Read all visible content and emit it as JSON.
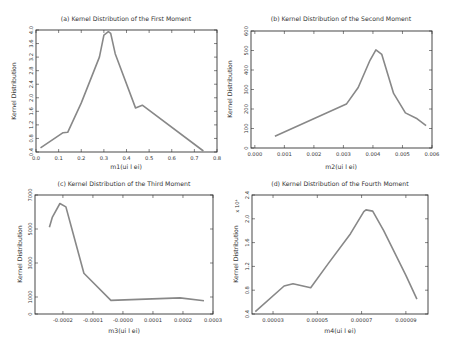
{
  "chart_data": [
    {
      "id": "a",
      "type": "line",
      "title": "(a) Kernel Distribution of the First Moment",
      "xlabel": "m1(ui l ei)",
      "ylabel": "Kernel Distribution",
      "xlim": [
        0.0,
        0.8
      ],
      "ylim": [
        0.4,
        4.0
      ],
      "xticks": [
        0.0,
        0.1,
        0.2,
        0.3,
        0.4,
        0.5,
        0.6,
        0.7,
        0.8
      ],
      "xtick_labels": [
        "0.0",
        "0.1",
        "0.2",
        "0.3",
        "0.4",
        "0.5",
        "0.6",
        "0.7",
        "0.8"
      ],
      "yticks": [
        0.4,
        0.8,
        1.2,
        1.6,
        2.0,
        2.4,
        2.8,
        3.2,
        3.6,
        4.0
      ],
      "ytick_labels": [
        "0.4",
        "0.8",
        "1.2",
        "1.6",
        "2.0",
        "2.4",
        "2.8",
        "3.2",
        "3.6",
        "4.0"
      ],
      "multiplier": "",
      "grid": false,
      "x": [
        0.02,
        0.12,
        0.14,
        0.2,
        0.28,
        0.3,
        0.32,
        0.33,
        0.35,
        0.44,
        0.47,
        0.74
      ],
      "y": [
        0.52,
        0.97,
        0.98,
        1.85,
        3.2,
        3.85,
        3.95,
        3.9,
        3.3,
        1.7,
        1.78,
        0.43
      ],
      "frame": {
        "left": 36,
        "top": 30,
        "right": 217,
        "bottom": 152
      }
    },
    {
      "id": "b",
      "type": "line",
      "title": "(b) Kernel Distribution of the Second Moment",
      "xlabel": "m2(ui l ei)",
      "ylabel": "Kernel Distribution",
      "xlim": [
        -0.00013,
        0.006
      ],
      "ylim": [
        0,
        600
      ],
      "xticks": [
        0.0,
        0.001,
        0.002,
        0.003,
        0.004,
        0.005,
        0.006
      ],
      "xtick_labels": [
        "0.000",
        "0.001",
        "0.002",
        "0.003",
        "0.004",
        "0.005",
        "0.006"
      ],
      "yticks": [
        0,
        100,
        200,
        300,
        400,
        500,
        600
      ],
      "ytick_labels": [
        "0",
        "100",
        "200",
        "300",
        "400",
        "500",
        "600"
      ],
      "multiplier": "",
      "grid": false,
      "x": [
        0.00068,
        0.0031,
        0.0035,
        0.0039,
        0.0041,
        0.0043,
        0.0047,
        0.0051,
        0.0055,
        0.0058
      ],
      "y": [
        60,
        225,
        310,
        450,
        503,
        480,
        280,
        180,
        150,
        115
      ],
      "frame": {
        "left": 251,
        "top": 31,
        "right": 432,
        "bottom": 148
      }
    },
    {
      "id": "c",
      "type": "line",
      "title": "(c) Kernel Distribution of the Third Moment",
      "xlabel": "m3(ui l ei)",
      "ylabel": "Kernel Distribution",
      "xlim": [
        -0.000293,
        0.0003
      ],
      "ylim": [
        0,
        7000
      ],
      "xticks": [
        -0.0002,
        -0.0001,
        0.0,
        0.0001,
        0.0002,
        0.0003
      ],
      "xtick_labels": [
        "-0.0002",
        "-0.0001",
        "-0.0000",
        "0.0001",
        "0.0002",
        "0.0003"
      ],
      "yticks": [
        0,
        1000,
        3000,
        5000,
        7000
      ],
      "ytick_labels": [
        "0",
        "1000",
        "3000",
        "5000",
        "7000"
      ],
      "multiplier": "",
      "grid": false,
      "x": [
        -0.000245,
        -0.000235,
        -0.00021,
        -0.00019,
        -0.00017,
        -0.00013,
        -4e-05,
        0.00019,
        0.00027
      ],
      "y": [
        5100,
        5700,
        6500,
        6300,
        5000,
        2400,
        800,
        950,
        780
      ],
      "frame": {
        "left": 35,
        "top": 195,
        "right": 213,
        "bottom": 314
      }
    },
    {
      "id": "d",
      "type": "line",
      "title": "(d) Kernel Distribution of the Fourth Moment",
      "xlabel": "m4(ui l ei)",
      "ylabel": "Kernel Distribution",
      "xlim": [
        2.05e-05,
        0.0001
      ],
      "ylim": [
        0.4,
        2.4
      ],
      "xticks": [
        3e-05,
        5e-05,
        7e-05,
        9e-05
      ],
      "xtick_labels": [
        "0.00003",
        "0.00005",
        "0.00007",
        "0.00009"
      ],
      "yticks": [
        0.4,
        0.8,
        1.2,
        1.6,
        2.0,
        2.4
      ],
      "ytick_labels": [
        "0.4",
        "0.8",
        "1.2",
        "1.6",
        "2.0",
        "2.4"
      ],
      "multiplier": "x 10^4",
      "grid": false,
      "x": [
        2.2e-05,
        3.5e-05,
        3.9e-05,
        4.7e-05,
        5.5e-05,
        6.5e-05,
        7.1e-05,
        7.2e-05,
        7.5e-05,
        8e-05,
        9e-05,
        9.5e-05
      ],
      "y": [
        0.44,
        0.87,
        0.91,
        0.84,
        1.25,
        1.75,
        2.12,
        2.15,
        2.13,
        1.8,
        1.05,
        0.65
      ],
      "frame": {
        "left": 252,
        "top": 195,
        "right": 428,
        "bottom": 314
      }
    }
  ]
}
